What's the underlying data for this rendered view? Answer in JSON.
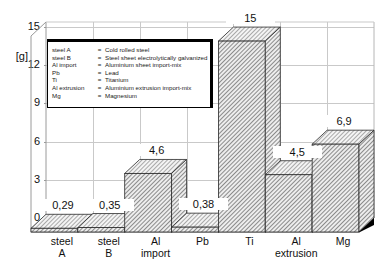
{
  "chart_data": {
    "type": "bar",
    "title": "",
    "xlabel": "",
    "ylabel": "[g]",
    "ylim": [
      0,
      16.5
    ],
    "yticks": [
      "0",
      "3",
      "6",
      "9",
      "12",
      "15"
    ],
    "ytick_values": [
      0,
      3,
      6,
      9,
      12,
      15
    ],
    "grid": true,
    "legend_position": "upper-left-inset",
    "categories": [
      "steel A",
      "steel B",
      "Al import",
      "Pb",
      "Ti",
      "Al extrusion",
      "Mg"
    ],
    "category_lines": [
      [
        "steel",
        "A"
      ],
      [
        "steel",
        "B"
      ],
      [
        "Al",
        "import"
      ],
      [
        "Pb",
        ""
      ],
      [
        "Ti",
        ""
      ],
      [
        "Al",
        "extrusion"
      ],
      [
        "Mg",
        ""
      ]
    ],
    "values": [
      0.29,
      0.35,
      4.6,
      0.38,
      15,
      4.5,
      6.9
    ],
    "value_labels": [
      "0,29",
      "0,35",
      "4,6",
      "0,38",
      "15",
      "4,5",
      "6,9"
    ],
    "series": [
      {
        "name": "",
        "values": [
          0.29,
          0.35,
          4.6,
          0.38,
          15,
          4.5,
          6.9
        ]
      }
    ],
    "bar_style": "3d-hatched",
    "colors": {
      "bar_fill": "#e8e8e8",
      "bar_hatch": "#4d4d4d",
      "bar_edge": "#000000",
      "grid": "#c9c9c9",
      "axis": "#8f8f8f",
      "text": "#111111"
    }
  },
  "legend": {
    "rows": [
      {
        "key": "steel A",
        "eq": "=",
        "desc": "Cold rolled steel"
      },
      {
        "key": "steel B",
        "eq": "=",
        "desc": "Steel sheet electrolytically galvanized"
      },
      {
        "key": "Al import",
        "eq": "=",
        "desc": "Aluminium sheet import-mix"
      },
      {
        "key": "Pb",
        "eq": "=",
        "desc": "Lead"
      },
      {
        "key": "Ti",
        "eq": "=",
        "desc": "Titanium"
      },
      {
        "key": "Al extrusion",
        "eq": "=",
        "desc": "Aluminium extrusion import-mix"
      },
      {
        "key": "Mg",
        "eq": "=",
        "desc": "Magnesium"
      }
    ]
  }
}
